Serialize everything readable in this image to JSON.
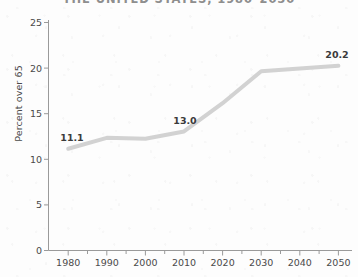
{
  "chart_data": {
    "type": "line",
    "title": "THE UNITED STATES, 1980–2050",
    "xlabel": "",
    "ylabel": "Percent over 65",
    "x": [
      1980,
      1990,
      2000,
      2010,
      2020,
      2030,
      2040,
      2050
    ],
    "categories": [
      "1980",
      "1990",
      "2000",
      "2010",
      "2020",
      "2030",
      "2040",
      "2050"
    ],
    "values": [
      11.1,
      12.3,
      12.2,
      13.0,
      16.1,
      19.6,
      19.9,
      20.2
    ],
    "series": [
      {
        "name": "Percent over 65",
        "values": [
          11.1,
          12.3,
          12.2,
          13.0,
          16.1,
          19.6,
          19.9,
          20.2
        ]
      }
    ],
    "xlim": [
      1975,
      2053
    ],
    "ylim": [
      0,
      25
    ],
    "xticks": [
      1980,
      1990,
      2000,
      2010,
      2020,
      2030,
      2040,
      2050
    ],
    "yticks": [
      0,
      5,
      10,
      15,
      20,
      25
    ],
    "xtick_labels": [
      "1980",
      "1990",
      "2000",
      "2010",
      "2020",
      "2030",
      "2040",
      "2050"
    ],
    "ytick_labels": [
      "0",
      "5",
      "10",
      "15",
      "20",
      "25"
    ],
    "grid": false,
    "legend": "none",
    "line_color": "#d2d2d2",
    "line_width": 4,
    "annotations": [
      {
        "text": "11.1",
        "x": 1980,
        "y": 11.1
      },
      {
        "text": "13.0",
        "x": 2010,
        "y": 13.0
      },
      {
        "text": "20.2",
        "x": 2050,
        "y": 20.2
      }
    ]
  },
  "axis": {
    "y_title": "Percent over 65",
    "y_ticks": [
      "0",
      "5",
      "10",
      "15",
      "20",
      "25"
    ],
    "x_ticks": [
      "1980",
      "1990",
      "2000",
      "2010",
      "2020",
      "2030",
      "2040",
      "2050"
    ]
  },
  "colors": {
    "background": "#fdfdfd",
    "line": "#d2d2d2",
    "axis": "#9a9a9a",
    "tick_text": "#4a4a4a",
    "label_text": "#3b3b3b",
    "title_text": "#8e8e8e"
  },
  "header": {
    "title": "THE UNITED STATES, 1980–2050"
  }
}
